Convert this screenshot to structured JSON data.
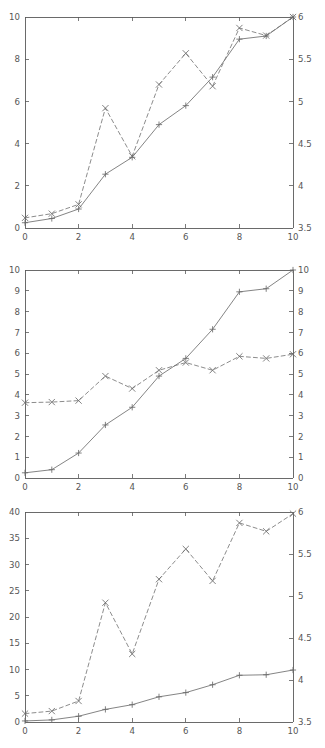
{
  "figure": {
    "title": "",
    "background_color": "#ffffff",
    "panel_count": 3,
    "line_color": "#6e6e6e",
    "axis_color": "#5a5a5a",
    "text_color": "#565656"
  },
  "chart_data": [
    {
      "type": "line",
      "title": "",
      "panel_index": 1,
      "xlabel": "",
      "ylabel": "",
      "y2label": "",
      "xlim": [
        0,
        10
      ],
      "ylim": [
        0,
        10
      ],
      "y2lim": [
        3.5,
        6
      ],
      "xticks": [
        0,
        2,
        4,
        6,
        8,
        10
      ],
      "xticklabels": [
        "0",
        "2",
        "4",
        "6",
        "8",
        "10"
      ],
      "yticks": [
        0,
        2,
        4,
        6,
        8,
        10
      ],
      "yticklabels": [
        "0",
        "2",
        "4",
        "6",
        "8",
        "10"
      ],
      "y2ticks": [
        3.5,
        4,
        4.5,
        5,
        5.5,
        6
      ],
      "y2ticklabels": [
        "3.5",
        "4",
        "4.5",
        "5",
        "5.5",
        "6"
      ],
      "grid": false,
      "legend": "none",
      "x": [
        0,
        1,
        2,
        3,
        4,
        5,
        6,
        7,
        8,
        9,
        10
      ],
      "series": [
        {
          "name": "solid-plus-series",
          "axis": "left",
          "linestyle": "solid",
          "marker": "plus",
          "values": [
            0.25,
            0.45,
            0.9,
            2.55,
            3.35,
            4.9,
            5.8,
            7.15,
            8.95,
            9.1,
            10.0
          ]
        },
        {
          "name": "dashed-cross-series",
          "axis": "right",
          "linestyle": "dashed",
          "marker": "cross",
          "values": [
            3.62,
            3.67,
            3.78,
            4.92,
            4.35,
            5.2,
            5.57,
            5.18,
            5.87,
            5.78,
            6.0
          ]
        }
      ]
    },
    {
      "type": "line",
      "title": "",
      "panel_index": 2,
      "xlabel": "",
      "ylabel": "",
      "y2label": "",
      "xlim": [
        0,
        10
      ],
      "ylim": [
        0,
        10
      ],
      "y2lim": [
        0,
        10
      ],
      "xticks": [
        0,
        2,
        4,
        6,
        8,
        10
      ],
      "xticklabels": [
        "0",
        "2",
        "4",
        "6",
        "8",
        "10"
      ],
      "yticks": [
        0,
        1,
        2,
        3,
        4,
        5,
        6,
        7,
        8,
        9,
        10
      ],
      "yticklabels": [
        "0",
        "1",
        "2",
        "3",
        "4",
        "5",
        "6",
        "7",
        "8",
        "9",
        "10"
      ],
      "y2ticks": [
        0,
        1,
        2,
        3,
        4,
        5,
        6,
        7,
        8,
        9,
        10
      ],
      "y2ticklabels": [
        "0",
        "1",
        "2",
        "3",
        "4",
        "5",
        "6",
        "7",
        "8",
        "9",
        "10"
      ],
      "grid": false,
      "legend": "none",
      "x": [
        0,
        1,
        2,
        3,
        4,
        5,
        6,
        7,
        8,
        9,
        10
      ],
      "series": [
        {
          "name": "solid-plus-series",
          "axis": "left",
          "linestyle": "solid",
          "marker": "plus",
          "values": [
            0.25,
            0.4,
            1.2,
            2.55,
            3.4,
            4.9,
            5.75,
            7.15,
            8.95,
            9.1,
            10.0
          ]
        },
        {
          "name": "dashed-cross-series",
          "axis": "right",
          "linestyle": "dashed",
          "marker": "cross",
          "values": [
            3.62,
            3.65,
            3.72,
            4.9,
            4.3,
            5.18,
            5.55,
            5.18,
            5.85,
            5.75,
            5.95
          ]
        }
      ]
    },
    {
      "type": "line",
      "title": "",
      "panel_index": 3,
      "xlabel": "",
      "ylabel": "",
      "y2label": "",
      "xlim": [
        0,
        10
      ],
      "ylim": [
        0,
        40
      ],
      "y2lim": [
        3.5,
        6
      ],
      "xticks": [
        0,
        2,
        4,
        6,
        8,
        10
      ],
      "xticklabels": [
        "0",
        "2",
        "4",
        "6",
        "8",
        "10"
      ],
      "yticks": [
        0,
        5,
        10,
        15,
        20,
        25,
        30,
        35,
        40
      ],
      "yticklabels": [
        "0",
        "5",
        "10",
        "15",
        "20",
        "25",
        "30",
        "35",
        "40"
      ],
      "y2ticks": [
        3.5,
        4,
        4.5,
        5,
        5.5,
        6
      ],
      "y2ticklabels": [
        "3.5",
        "4",
        "4.5",
        "5",
        "5.5",
        "6"
      ],
      "grid": false,
      "legend": "none",
      "x": [
        0,
        1,
        2,
        3,
        4,
        5,
        6,
        7,
        8,
        9,
        10
      ],
      "series": [
        {
          "name": "solid-plus-series",
          "axis": "left",
          "linestyle": "solid",
          "marker": "plus",
          "values": [
            0.2,
            0.4,
            1.1,
            2.4,
            3.3,
            4.8,
            5.6,
            7.1,
            8.9,
            9.0,
            9.9
          ]
        },
        {
          "name": "dashed-cross-series",
          "axis": "right",
          "linestyle": "dashed",
          "marker": "cross",
          "values": [
            3.6,
            3.63,
            3.75,
            4.92,
            4.31,
            5.2,
            5.56,
            5.18,
            5.87,
            5.77,
            5.98
          ]
        }
      ]
    }
  ]
}
